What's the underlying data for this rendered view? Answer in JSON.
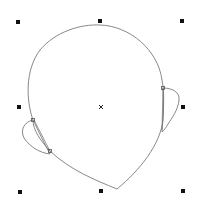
{
  "canvas": {
    "background": "#ffffff",
    "stroke_color": "#7a7a7a",
    "handle_color": "#111111"
  },
  "selection": {
    "handles": [
      {
        "name": "top-left",
        "x": 18,
        "y": 22
      },
      {
        "name": "top-center",
        "x": 100,
        "y": 21
      },
      {
        "name": "top-right",
        "x": 182,
        "y": 21
      },
      {
        "name": "middle-left",
        "x": 19,
        "y": 107
      },
      {
        "name": "middle-right",
        "x": 183,
        "y": 107
      },
      {
        "name": "bottom-left",
        "x": 20,
        "y": 192
      },
      {
        "name": "bottom-center",
        "x": 101,
        "y": 191
      },
      {
        "name": "bottom-right",
        "x": 183,
        "y": 191
      }
    ],
    "center_marker": {
      "x": 101,
      "y": 107,
      "glyph": "×"
    }
  },
  "shape": {
    "name": "head-outline",
    "nodes": [
      {
        "name": "left-ear-top-node",
        "x": 33,
        "y": 120
      },
      {
        "name": "left-ear-bottom-node",
        "x": 50,
        "y": 151
      },
      {
        "name": "right-ear-top-node",
        "x": 163,
        "y": 88
      }
    ]
  }
}
